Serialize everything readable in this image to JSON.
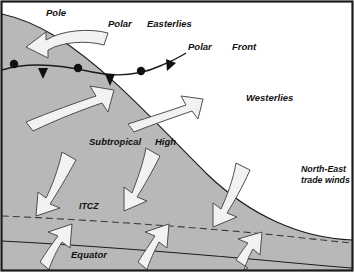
{
  "figure": {
    "width": 354,
    "height": 272
  },
  "colors": {
    "frame": "#1a1a1a",
    "globe_fill": "#b8b8b8",
    "outside_fill": "#ffffff",
    "arrow_fill": "#f2f2f2",
    "arrow_stroke": "#4d4d4d",
    "line": "#1a1a1a",
    "text": "#111111"
  },
  "labels": {
    "pole": "Pole",
    "polar": "Polar",
    "easterlies": "Easterlies",
    "polar_front_word1": "Polar",
    "polar_front_word2": "Front",
    "westerlies": "Westerlies",
    "subtropical": "Subtropical",
    "high": "High",
    "itcz": "ITCZ",
    "equator": "Equator",
    "trade_line1": "North-East",
    "trade_line2": "trade winds"
  },
  "features": {
    "globe_edge": "curved limb of the globe running from top-left to bottom-right",
    "polar_front": "occluded front line with alternating filled semicircles and triangles",
    "itcz_line": "dashed line marking the Intertropical Convergence Zone",
    "equator_line": "solid line marking the Equator",
    "arrows": [
      {
        "name": "polar-easterlies-arrow",
        "direction": "curving to the lower-left",
        "belt": "Polar Easterlies"
      },
      {
        "name": "westerlies-arrow-left",
        "direction": "to the upper-right",
        "belt": "Westerlies"
      },
      {
        "name": "westerlies-arrow-right",
        "direction": "to the upper-right",
        "belt": "Westerlies"
      },
      {
        "name": "trade-wind-arrow-left",
        "direction": "to the lower-left",
        "belt": "North-East trade winds"
      },
      {
        "name": "trade-wind-arrow-middle",
        "direction": "to the lower-left",
        "belt": "North-East trade winds"
      },
      {
        "name": "trade-wind-arrow-right",
        "direction": "to the lower-left",
        "belt": "North-East trade winds"
      },
      {
        "name": "equatorial-arrow-left",
        "direction": "to the upper-left",
        "belt": "Equatorial convergence"
      },
      {
        "name": "equatorial-arrow-middle",
        "direction": "to the upper-left",
        "belt": "Equatorial convergence"
      },
      {
        "name": "equatorial-arrow-right",
        "direction": "to the upper-left",
        "belt": "Equatorial convergence"
      }
    ]
  }
}
